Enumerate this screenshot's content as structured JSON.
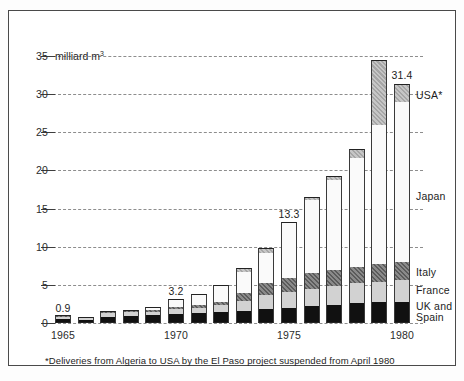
{
  "chart_data": {
    "type": "bar",
    "title": "",
    "subtitle": "",
    "stacked": true,
    "xlabel": "",
    "ylabel": "35 milliard m³",
    "y_unit_label": "milliard m",
    "y_unit_exponent": "3",
    "ylim": [
      0,
      35
    ],
    "yticks": [
      0,
      5,
      10,
      15,
      20,
      25,
      30,
      35
    ],
    "ytick_labels": [
      "0",
      "5",
      "10",
      "15",
      "20",
      "25",
      "30",
      "35"
    ],
    "grid": true,
    "legend_position": "right-inline",
    "categories": [
      "1965",
      "1966",
      "1967",
      "1968",
      "1969",
      "1970",
      "1971",
      "1972",
      "1973",
      "1974",
      "1975",
      "1976",
      "1977",
      "1978",
      "1979",
      "1980"
    ],
    "xtick_labels_shown": [
      "1965",
      "1970",
      "1975",
      "1980"
    ],
    "series": [
      {
        "name": "UK and Spain",
        "color": "#111111",
        "pattern": "solid-black",
        "values": [
          0.5,
          0.35,
          0.8,
          0.9,
          1.0,
          1.2,
          1.3,
          1.5,
          1.6,
          1.8,
          2.0,
          2.2,
          2.4,
          2.6,
          2.7,
          2.8
        ]
      },
      {
        "name": "France",
        "color": "#d2d2d2",
        "pattern": "solid-light-gray",
        "values": [
          0.35,
          0.3,
          0.5,
          0.5,
          0.5,
          0.6,
          0.7,
          0.9,
          1.3,
          1.9,
          2.1,
          2.3,
          2.5,
          2.6,
          2.7,
          2.8
        ]
      },
      {
        "name": "Italy",
        "color": "#6a6a6a",
        "pattern": "dark-hatch",
        "values": [
          0.05,
          0.05,
          0.1,
          0.1,
          0.2,
          0.3,
          0.3,
          0.4,
          1.0,
          1.6,
          1.8,
          2.0,
          2.1,
          2.2,
          2.3,
          2.4
        ]
      },
      {
        "name": "Japan",
        "color": "#fafafa",
        "pattern": "white",
        "values": [
          0.0,
          0.0,
          0.1,
          0.2,
          0.4,
          1.1,
          1.5,
          2.2,
          2.8,
          3.9,
          7.4,
          9.6,
          11.7,
          14.2,
          18.3,
          21.0
        ]
      },
      {
        "name": "USA*",
        "color": "#b4b4b4",
        "pattern": "medium-hatch",
        "values": [
          0.0,
          0.0,
          0.0,
          0.0,
          0.0,
          0.0,
          0.0,
          0.0,
          0.5,
          0.6,
          0.0,
          0.4,
          0.6,
          1.2,
          8.5,
          2.4
        ]
      }
    ],
    "totals": [
      0.9,
      0.7,
      1.5,
      1.7,
      2.1,
      3.2,
      3.8,
      5.0,
      7.2,
      9.8,
      13.3,
      16.5,
      19.3,
      22.8,
      34.5,
      31.4
    ],
    "data_labels": [
      {
        "category": "1965",
        "value": 0.9,
        "text": "0.9"
      },
      {
        "category": "1970",
        "value": 3.2,
        "text": "3.2"
      },
      {
        "category": "1975",
        "value": 13.3,
        "text": "13.3"
      },
      {
        "category": "1980",
        "value": 31.4,
        "text": "31.4"
      }
    ],
    "legend_entries": [
      {
        "label": "USA*",
        "series": "USA*"
      },
      {
        "label": "Japan",
        "series": "Japan"
      },
      {
        "label": "Italy",
        "series": "Italy"
      },
      {
        "label": "France",
        "series": "France"
      },
      {
        "label": "UK and",
        "label2": "Spain",
        "series": "UK and Spain"
      }
    ],
    "footnote": "*Deliveries from Algeria to USA by the El Paso project suspended from April 1980"
  },
  "legend": {
    "usa": "USA*",
    "japan": "Japan",
    "italy": "Italy",
    "france": "France",
    "uk_line1": "UK and",
    "uk_line2": "Spain"
  },
  "labels": {
    "val_1965": "0.9",
    "val_1970": "3.2",
    "val_1975": "13.3",
    "val_1980": "31.4",
    "y35": "35",
    "y30": "30",
    "y25": "25",
    "y20": "20",
    "y15": "15",
    "y10": "10",
    "y5": "5",
    "y0": "0",
    "unit": "milliard m",
    "unit_exp": "3",
    "x1965": "1965",
    "x1970": "1970",
    "x1975": "1975",
    "x1980": "1980"
  },
  "footnote": {
    "text": "*Deliveries from Algeria to USA by the El Paso project suspended from April 1980"
  },
  "colors": {
    "uk_spain": "#111111",
    "france": "#d2d2d2",
    "italy": "#6a6a6a",
    "japan": "#fafafa",
    "usa": "#b4b4b4",
    "frame": "#4a4a4a",
    "grid": "#8d8d8d"
  }
}
